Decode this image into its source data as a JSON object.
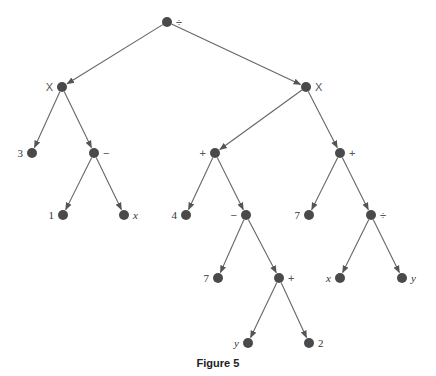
{
  "figure": {
    "caption": "Figure 5",
    "node_color": "#4a4a4a",
    "edge_color": "#666666"
  },
  "tree": {
    "nodes": [
      {
        "id": "n0",
        "label": "÷",
        "x": 167,
        "y": 22,
        "label_side": "right",
        "style": "sans"
      },
      {
        "id": "n1",
        "label": "X",
        "x": 62,
        "y": 87,
        "label_side": "left",
        "style": "sans"
      },
      {
        "id": "n2",
        "label": "X",
        "x": 306,
        "y": 87,
        "label_side": "right",
        "style": "sans"
      },
      {
        "id": "n3",
        "label": "3",
        "x": 32,
        "y": 153,
        "label_side": "left",
        "style": "serif"
      },
      {
        "id": "n4",
        "label": "−",
        "x": 94,
        "y": 153,
        "label_side": "right",
        "style": "sans"
      },
      {
        "id": "n5",
        "label": "1",
        "x": 63,
        "y": 215,
        "label_side": "left",
        "style": "serif"
      },
      {
        "id": "n6",
        "label": "x",
        "x": 124,
        "y": 215,
        "label_side": "right",
        "style": "italic"
      },
      {
        "id": "n7",
        "label": "+",
        "x": 215,
        "y": 153,
        "label_side": "left",
        "style": "sans"
      },
      {
        "id": "n8",
        "label": "+",
        "x": 340,
        "y": 153,
        "label_side": "right",
        "style": "sans"
      },
      {
        "id": "n9",
        "label": "4",
        "x": 186,
        "y": 215,
        "label_side": "left",
        "style": "serif"
      },
      {
        "id": "n10",
        "label": "−",
        "x": 246,
        "y": 215,
        "label_side": "left",
        "style": "sans"
      },
      {
        "id": "n11",
        "label": "7",
        "x": 309,
        "y": 215,
        "label_side": "left",
        "style": "serif"
      },
      {
        "id": "n12",
        "label": "÷",
        "x": 371,
        "y": 215,
        "label_side": "right",
        "style": "sans"
      },
      {
        "id": "n13",
        "label": "7",
        "x": 218,
        "y": 278,
        "label_side": "left",
        "style": "serif"
      },
      {
        "id": "n14",
        "label": "+",
        "x": 279,
        "y": 278,
        "label_side": "right",
        "style": "sans"
      },
      {
        "id": "n15",
        "label": "x",
        "x": 340,
        "y": 278,
        "label_side": "left",
        "style": "italic"
      },
      {
        "id": "n16",
        "label": "y",
        "x": 402,
        "y": 278,
        "label_side": "right",
        "style": "italic"
      },
      {
        "id": "n17",
        "label": "y",
        "x": 248,
        "y": 343,
        "label_side": "left",
        "style": "italic"
      },
      {
        "id": "n18",
        "label": "2",
        "x": 309,
        "y": 343,
        "label_side": "right",
        "style": "serif"
      }
    ],
    "edges": [
      [
        "n0",
        "n1"
      ],
      [
        "n0",
        "n2"
      ],
      [
        "n1",
        "n3"
      ],
      [
        "n1",
        "n4"
      ],
      [
        "n4",
        "n5"
      ],
      [
        "n4",
        "n6"
      ],
      [
        "n2",
        "n7"
      ],
      [
        "n2",
        "n8"
      ],
      [
        "n7",
        "n9"
      ],
      [
        "n7",
        "n10"
      ],
      [
        "n10",
        "n13"
      ],
      [
        "n10",
        "n14"
      ],
      [
        "n14",
        "n17"
      ],
      [
        "n14",
        "n18"
      ],
      [
        "n8",
        "n11"
      ],
      [
        "n8",
        "n12"
      ],
      [
        "n12",
        "n15"
      ],
      [
        "n12",
        "n16"
      ]
    ]
  }
}
